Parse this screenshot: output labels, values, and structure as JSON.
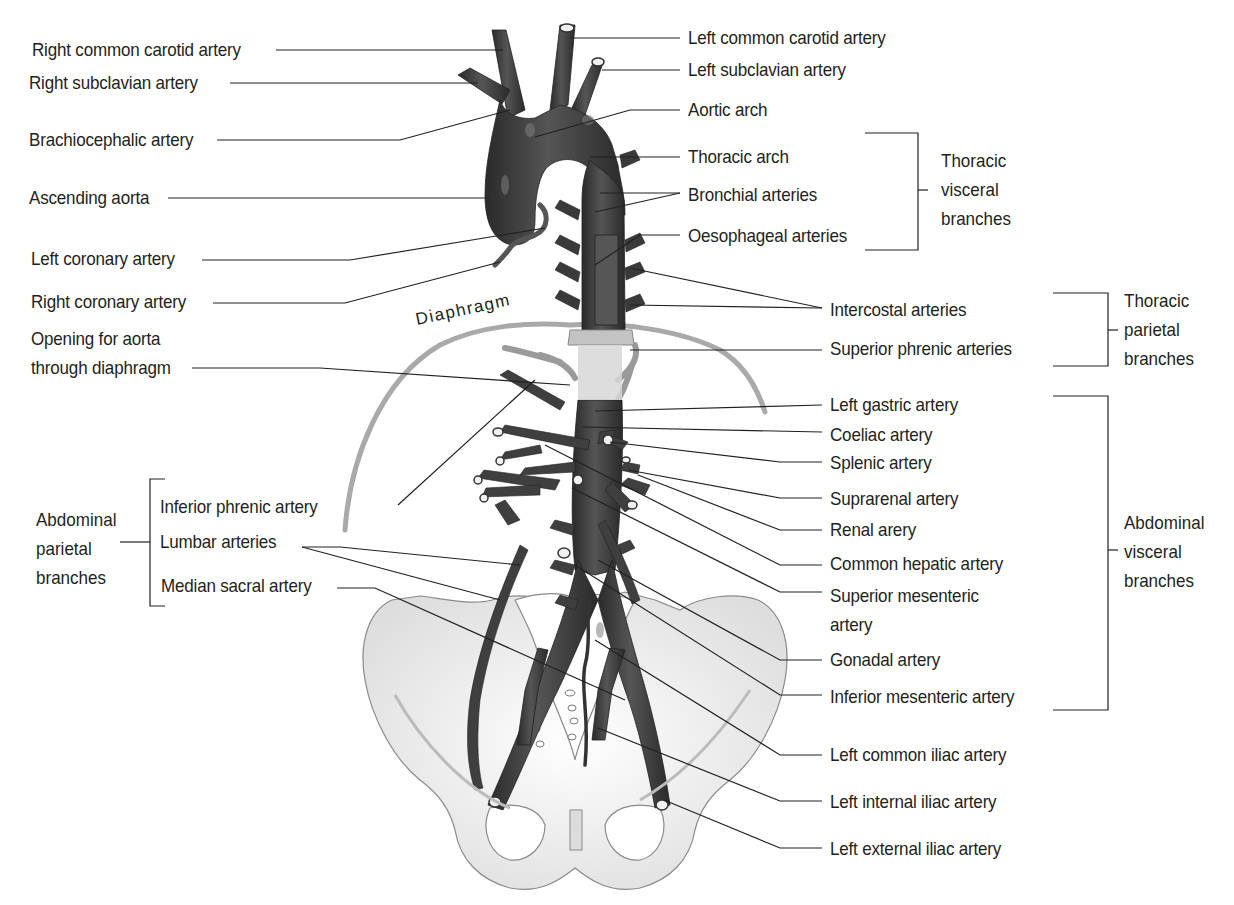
{
  "figure": {
    "structure_label": "Diaphragm"
  },
  "left_labels": {
    "right_common_carotid": "Right common carotid artery",
    "right_subclavian": "Right subclavian artery",
    "brachiocephalic": "Brachiocephalic artery",
    "ascending_aorta": "Ascending aorta",
    "left_coronary": "Left coronary artery",
    "right_coronary": "Right coronary artery",
    "opening_line1": "Opening for aorta",
    "opening_line2": "through diaphragm",
    "inferior_phrenic": "Inferior phrenic artery",
    "lumbar": "Lumbar arteries",
    "median_sacral": "Median sacral artery"
  },
  "right_labels": {
    "left_common_carotid": "Left common carotid artery",
    "left_subclavian": "Left subclavian artery",
    "aortic_arch": "Aortic arch",
    "thoracic_arch": "Thoracic arch",
    "bronchial": "Bronchial arteries",
    "oesophageal": "Oesophageal arteries",
    "intercostal": "Intercostal arteries",
    "superior_phrenic": "Superior phrenic arteries",
    "left_gastric": "Left gastric artery",
    "coeliac": "Coeliac artery",
    "splenic": "Splenic artery",
    "suprarenal": "Suprarenal artery",
    "renal": "Renal arery",
    "common_hepatic": "Common hepatic artery",
    "superior_mesenteric_line1": "Superior mesenteric",
    "superior_mesenteric_line2": "artery",
    "gonadal": "Gonadal artery",
    "inferior_mesenteric": "Inferior mesenteric artery",
    "left_common_iliac": "Left common iliac artery",
    "left_internal_iliac": "Left internal iliac artery",
    "left_external_iliac": "Left external iliac artery"
  },
  "groups": {
    "thoracic_visceral": [
      "Thoracic",
      "visceral",
      "branches"
    ],
    "thoracic_parietal": [
      "Thoracic",
      "parietal",
      "branches"
    ],
    "abdominal_visceral": [
      "Abdominal",
      "visceral",
      "branches"
    ],
    "abdominal_parietal": [
      "Abdominal",
      "parietal",
      "branches"
    ]
  },
  "colors": {
    "artery": "#3a3a3a",
    "artery_highlight": "#6e6e6e",
    "bone": "#f4f4f4",
    "bone_outline": "#8a8a8a",
    "diaphragm": "#a9a9a9",
    "leader_line": "#231f20",
    "text": "#231f20"
  }
}
